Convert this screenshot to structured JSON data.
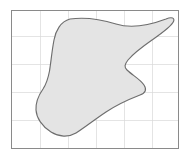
{
  "figure": {
    "kind": "geometry-diagram",
    "background_color": "#ffffff",
    "canvas": {
      "width": 189,
      "height": 161
    }
  },
  "plot_frame": {
    "label": "plot border rectangle",
    "x": 11.5,
    "y": 10.5,
    "width": 167,
    "height": 138,
    "stroke_color": "#8a8a8a",
    "fill_color": "#ffffff"
  },
  "grid": {
    "label": "background grid",
    "stroke_color": "#d8d8d8",
    "spacing_px": 28,
    "vertical_x": [
      40,
      68,
      96,
      124,
      152
    ],
    "horizontal_y": [
      36,
      64,
      92,
      120
    ]
  },
  "region": {
    "label": "shaded blob region",
    "fill_color": "#e4e4e4",
    "stroke_color": "#6e6e6e",
    "path": "M 70 19 C 84 17, 100 19, 116 24 C 132 29, 150 25, 166 19 C 172 16.5, 175 18, 173.5 21.5 C 171.5 26.5, 162 33, 152 40 C 142 47, 133 54, 128 60 C 124.5 64.5, 124 67, 127 70 C 132 75, 140 79, 144 85 C 147 89.5, 145.5 93, 140 95 C 131 98.5, 118 104, 106 112 C 94 120, 84 128, 76 133 C 68.5 137.5, 59 137, 51 132 C 42 126.5, 36.5 118, 36 110 C 35.5 101, 39.5 94, 43 89 C 46 84.5, 48 79, 49.5 71 C 51 62, 52 50, 54 40 C 55.5 31, 60.5 21.5, 70 19 Z",
    "vertices_hint": [
      {
        "name": "top-left-shoulder",
        "x": 56,
        "y": 21
      },
      {
        "name": "top-right-tip",
        "x": 173,
        "y": 21
      },
      {
        "name": "right-notch-inflection",
        "x": 124,
        "y": 65
      },
      {
        "name": "right-lower-bulge",
        "x": 145,
        "y": 89
      },
      {
        "name": "bottom-lobe",
        "x": 64,
        "y": 135
      },
      {
        "name": "left-waist",
        "x": 43,
        "y": 89
      }
    ]
  }
}
